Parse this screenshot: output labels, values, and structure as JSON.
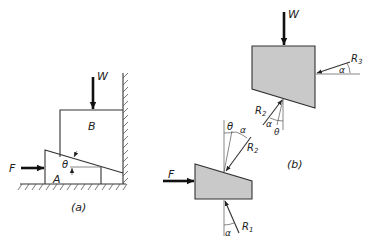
{
  "figure": {
    "panel_a": {
      "caption": "(a)",
      "labels": {
        "load": "W",
        "block_upper": "B",
        "block_wedge": "A",
        "push_force": "F",
        "wedge_angle": "θ"
      }
    },
    "panel_b": {
      "caption": "(b)",
      "upper_block": {
        "load": "W",
        "wall_reaction": "R",
        "wall_reaction_sub": "3",
        "wall_angle": "α",
        "contact_reaction": "R",
        "contact_reaction_sub": "2",
        "contact_angle_friction": "α",
        "contact_angle_wedge": "θ"
      },
      "wedge_block": {
        "push_force": "F",
        "top_reaction": "R",
        "top_reaction_sub": "2",
        "top_angle_wedge": "θ",
        "top_angle_friction": "α",
        "floor_reaction": "R",
        "floor_reaction_sub": "1",
        "floor_angle": "α"
      }
    },
    "colors": {
      "shading": "#c9c9c9",
      "lines": "#333333",
      "background": "#ffffff"
    }
  }
}
